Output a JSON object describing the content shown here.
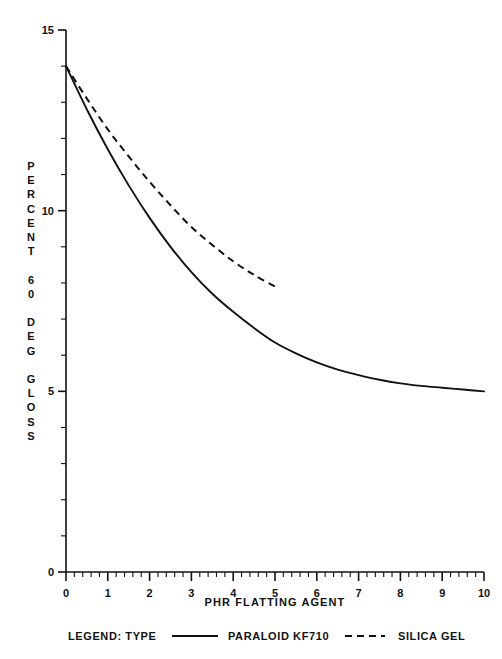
{
  "chart_data": {
    "type": "line",
    "title": "",
    "subtitle": "",
    "xlabel": "PHR FLATTING AGENT",
    "ylabel": "PERCENT 60 DEG GLOSS",
    "ylabel_lines": [
      "PERCENT",
      "60",
      "DEG",
      "GLOSS"
    ],
    "xlim": [
      0,
      10
    ],
    "ylim": [
      0,
      15
    ],
    "xticks": [
      0,
      1,
      2,
      3,
      4,
      5,
      6,
      7,
      8,
      9,
      10
    ],
    "xtick_labels": [
      "0",
      "1",
      "2",
      "3",
      "4",
      "5",
      "6",
      "7",
      "8",
      "9",
      "10"
    ],
    "yticks": [
      0,
      5,
      10,
      15
    ],
    "ytick_labels": [
      "0",
      "5",
      "10",
      "15"
    ],
    "y_minor_step": 1,
    "x_minor_step": 0.2,
    "grid": false,
    "legend_position": "below-axis",
    "legend_title": "LEGEND: TYPE",
    "series": [
      {
        "name": "PARALOID KF710",
        "style": "solid",
        "color": "#111111",
        "x": [
          0,
          0.5,
          1,
          1.5,
          2,
          2.5,
          3,
          3.5,
          4,
          4.5,
          5,
          5.5,
          6,
          6.5,
          7,
          7.5,
          8,
          8.5,
          9,
          9.5,
          10
        ],
        "y": [
          14.0,
          12.8,
          11.7,
          10.7,
          9.8,
          9.0,
          8.3,
          7.7,
          7.2,
          6.75,
          6.35,
          6.05,
          5.8,
          5.6,
          5.45,
          5.32,
          5.22,
          5.15,
          5.1,
          5.05,
          5.0
        ]
      },
      {
        "name": "SILICA GEL",
        "style": "dashed",
        "color": "#111111",
        "x": [
          0,
          0.5,
          1,
          1.5,
          2,
          2.5,
          3,
          3.5,
          4,
          4.5,
          5
        ],
        "y": [
          14.0,
          13.1,
          12.25,
          11.5,
          10.8,
          10.15,
          9.55,
          9.05,
          8.6,
          8.22,
          7.9
        ]
      }
    ]
  },
  "legend": {
    "label": "LEGEND: TYPE",
    "entries": [
      {
        "label": "PARALOID KF710",
        "style": "solid"
      },
      {
        "label": "SILICA GEL",
        "style": "dashed"
      }
    ]
  },
  "colors": {
    "ink": "#111111",
    "background": "#ffffff"
  }
}
